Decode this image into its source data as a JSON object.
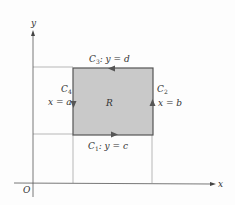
{
  "figure": {
    "axes": {
      "x_label": "x",
      "y_label": "y",
      "origin_label": "O"
    },
    "region": {
      "label": "R",
      "fill_color": "#c9c9c9",
      "edge_color": "#555555"
    },
    "curves": [
      {
        "id": "C1",
        "name": "C",
        "sub": "1",
        "equation": ": y = c",
        "direction": "right"
      },
      {
        "id": "C2",
        "name": "C",
        "sub": "2",
        "equation": "x = b",
        "direction": "up"
      },
      {
        "id": "C3",
        "name": "C",
        "sub": "3",
        "equation": ": y = d",
        "direction": "left"
      },
      {
        "id": "C4",
        "name": "C",
        "sub": "4",
        "equation": "x = a",
        "direction": "down"
      }
    ]
  }
}
